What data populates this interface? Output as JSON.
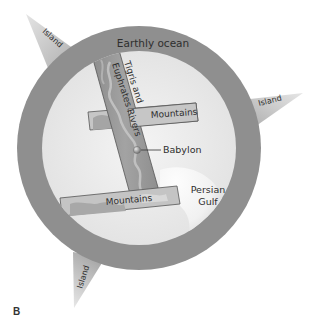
{
  "figure": {
    "label": "B"
  },
  "labels": {
    "ocean": "Earthly ocean",
    "river_line1": "Tigris and",
    "river_line2": "Euphrates Rivers",
    "mountains_top": "Mountains",
    "mountains_bottom": "Mountains",
    "city": "Babylon",
    "gulf_line1": "Persian",
    "gulf_line2": "Gulf",
    "island_top_left": "Island",
    "island_right": "Island",
    "island_bottom_left": "Island"
  },
  "colors": {
    "ocean_ring": "#8f8f8f",
    "land": "#ececec",
    "river_band": "#9a9a9a",
    "mountain_strip": "#c4c4c4",
    "island": "#c9c9c9",
    "text": "#2e2e2e",
    "background": "#ffffff"
  }
}
